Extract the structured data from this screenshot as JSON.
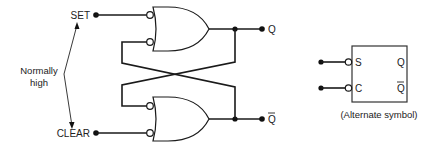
{
  "diagram": {
    "inputs": {
      "set_label": "SET",
      "clear_label": "CLEAR"
    },
    "annotation": {
      "line1": "Normally",
      "line2": "high"
    },
    "outputs": {
      "q_label": "Q",
      "q_bar_label": "Q"
    },
    "alternate_symbol": {
      "s_label": "S",
      "c_label": "C",
      "q_label": "Q",
      "q_bar_label": "Q",
      "caption": "(Alternate symbol)"
    },
    "colors": {
      "line": "#1a1a1a",
      "text": "#222222",
      "background": "#ffffff"
    }
  }
}
